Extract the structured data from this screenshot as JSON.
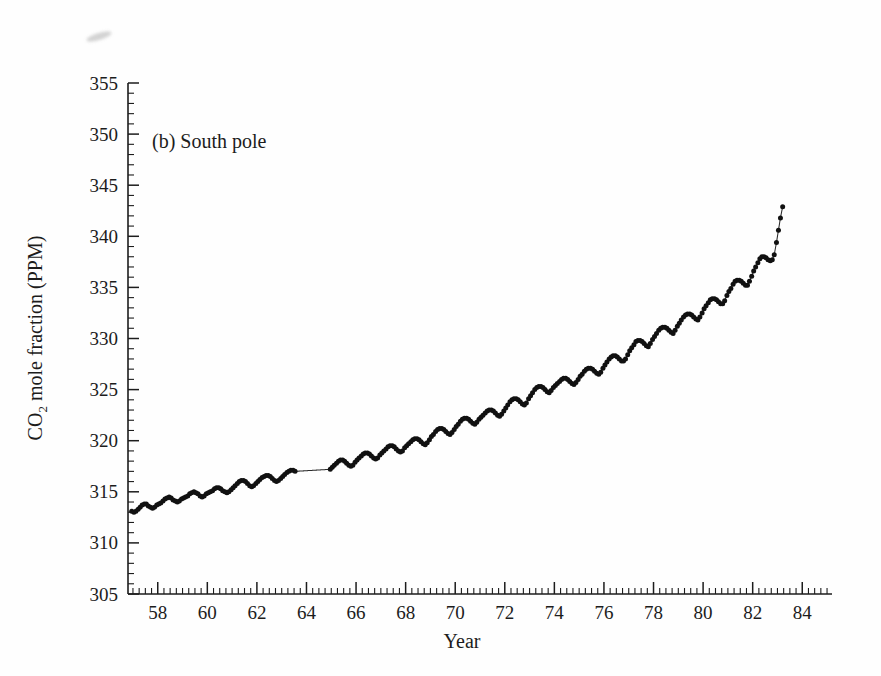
{
  "figure": {
    "panel_label": "(b) South pole",
    "background_color": "#fefefe",
    "ink_color": "#1a1a1a"
  },
  "artifact": {
    "name": "scan-smudge",
    "description": "faint grey scanning smudge near top-left"
  },
  "chart_data": {
    "type": "line",
    "title": "(b) South pole",
    "xlabel": "Year",
    "ylabel": "CO2 mole fraction (PPM)",
    "ylabel_rich": {
      "prefix": "CO",
      "subscript": "2",
      "suffix": " mole fraction (PPM)"
    },
    "xlim": [
      56.8,
      85.2
    ],
    "ylim": [
      305,
      355
    ],
    "xticks": [
      58,
      60,
      62,
      64,
      66,
      68,
      70,
      72,
      74,
      76,
      78,
      80,
      82,
      84
    ],
    "xtick_labels": [
      "58",
      "60",
      "62",
      "64",
      "66",
      "68",
      "70",
      "72",
      "74",
      "76",
      "78",
      "80",
      "82",
      "84"
    ],
    "yticks": [
      305,
      310,
      315,
      320,
      325,
      330,
      335,
      340,
      345,
      350,
      355
    ],
    "ytick_labels": [
      "305",
      "310",
      "315",
      "320",
      "325",
      "330",
      "335",
      "340",
      "345",
      "350",
      "355"
    ],
    "x_minor_tick_interval": 0.25,
    "y_minor_tick_interval": 1,
    "grid": false,
    "legend": null,
    "marker": "dot",
    "series": [
      {
        "name": "South Pole CO2 mole fraction",
        "units": "PPM",
        "x_units": "year (19xx)",
        "data_gap_years": [
          [
            63.6,
            64.9
          ]
        ],
        "x": [
          56.95,
          57.04,
          57.12,
          57.21,
          57.29,
          57.37,
          57.46,
          57.54,
          57.62,
          57.71,
          57.79,
          57.87,
          57.96,
          58.04,
          58.12,
          58.21,
          58.29,
          58.37,
          58.46,
          58.54,
          58.62,
          58.71,
          58.79,
          58.87,
          58.96,
          59.04,
          59.12,
          59.21,
          59.29,
          59.37,
          59.46,
          59.54,
          59.62,
          59.71,
          59.79,
          59.87,
          59.96,
          60.04,
          60.12,
          60.21,
          60.29,
          60.37,
          60.46,
          60.54,
          60.62,
          60.71,
          60.79,
          60.87,
          60.96,
          61.04,
          61.12,
          61.21,
          61.29,
          61.37,
          61.46,
          61.54,
          61.62,
          61.71,
          61.79,
          61.87,
          61.96,
          62.04,
          62.12,
          62.21,
          62.29,
          62.37,
          62.46,
          62.54,
          62.62,
          62.71,
          62.79,
          62.87,
          62.96,
          63.04,
          63.12,
          63.21,
          63.29,
          63.37,
          63.46,
          63.54,
          64.96,
          65.04,
          65.12,
          65.21,
          65.29,
          65.37,
          65.46,
          65.54,
          65.62,
          65.71,
          65.79,
          65.87,
          65.96,
          66.04,
          66.12,
          66.21,
          66.29,
          66.37,
          66.46,
          66.54,
          66.62,
          66.71,
          66.79,
          66.87,
          66.96,
          67.04,
          67.12,
          67.21,
          67.29,
          67.37,
          67.46,
          67.54,
          67.62,
          67.71,
          67.79,
          67.87,
          67.96,
          68.04,
          68.12,
          68.21,
          68.29,
          68.37,
          68.46,
          68.54,
          68.62,
          68.71,
          68.79,
          68.87,
          68.96,
          69.04,
          69.12,
          69.21,
          69.29,
          69.37,
          69.46,
          69.54,
          69.62,
          69.71,
          69.79,
          69.87,
          69.96,
          70.04,
          70.12,
          70.21,
          70.29,
          70.37,
          70.46,
          70.54,
          70.62,
          70.71,
          70.79,
          70.87,
          70.96,
          71.04,
          71.12,
          71.21,
          71.29,
          71.37,
          71.46,
          71.54,
          71.62,
          71.71,
          71.79,
          71.87,
          71.96,
          72.04,
          72.12,
          72.21,
          72.29,
          72.37,
          72.46,
          72.54,
          72.62,
          72.71,
          72.79,
          72.87,
          72.96,
          73.04,
          73.12,
          73.21,
          73.29,
          73.37,
          73.46,
          73.54,
          73.62,
          73.71,
          73.79,
          73.87,
          73.96,
          74.04,
          74.12,
          74.21,
          74.29,
          74.37,
          74.46,
          74.54,
          74.62,
          74.71,
          74.79,
          74.87,
          74.96,
          75.04,
          75.12,
          75.21,
          75.29,
          75.37,
          75.46,
          75.54,
          75.62,
          75.71,
          75.79,
          75.87,
          75.96,
          76.04,
          76.12,
          76.21,
          76.29,
          76.37,
          76.46,
          76.54,
          76.62,
          76.71,
          76.79,
          76.87,
          76.96,
          77.04,
          77.12,
          77.21,
          77.29,
          77.37,
          77.46,
          77.54,
          77.62,
          77.71,
          77.79,
          77.87,
          77.96,
          78.04,
          78.12,
          78.21,
          78.29,
          78.37,
          78.46,
          78.54,
          78.62,
          78.71,
          78.79,
          78.87,
          78.96,
          79.04,
          79.12,
          79.21,
          79.29,
          79.37,
          79.46,
          79.54,
          79.62,
          79.71,
          79.79,
          79.87,
          79.96,
          80.04,
          80.12,
          80.21,
          80.29,
          80.37,
          80.46,
          80.54,
          80.62,
          80.71,
          80.79,
          80.87,
          80.96,
          81.04,
          81.12,
          81.21,
          81.29,
          81.37,
          81.46,
          81.54,
          81.62,
          81.71,
          81.79,
          81.87,
          81.96,
          82.04,
          82.12,
          82.21,
          82.29,
          82.37,
          82.46,
          82.54,
          82.62,
          82.71,
          82.79,
          82.87,
          82.96,
          83.04,
          83.12,
          83.21
        ],
        "y": [
          313.1,
          313.0,
          313.1,
          313.3,
          313.5,
          313.7,
          313.8,
          313.8,
          313.6,
          313.5,
          313.4,
          313.5,
          313.7,
          313.8,
          313.9,
          314.1,
          314.3,
          314.4,
          314.5,
          314.4,
          314.2,
          314.1,
          314.0,
          314.1,
          314.3,
          314.4,
          314.5,
          314.6,
          314.8,
          314.9,
          315.0,
          314.9,
          314.8,
          314.6,
          314.5,
          314.6,
          314.8,
          314.9,
          315.0,
          315.1,
          315.3,
          315.4,
          315.4,
          315.3,
          315.1,
          315.0,
          314.9,
          315.0,
          315.2,
          315.4,
          315.6,
          315.8,
          316.0,
          316.1,
          316.1,
          316.0,
          315.8,
          315.6,
          315.5,
          315.6,
          315.8,
          316.0,
          316.2,
          316.4,
          316.5,
          316.6,
          316.6,
          316.5,
          316.3,
          316.1,
          316.0,
          316.1,
          316.3,
          316.5,
          316.7,
          316.9,
          317.0,
          317.1,
          317.1,
          317.0,
          317.2,
          317.4,
          317.6,
          317.8,
          318.0,
          318.1,
          318.1,
          318.0,
          317.8,
          317.6,
          317.5,
          317.6,
          317.9,
          318.1,
          318.3,
          318.5,
          318.7,
          318.8,
          318.8,
          318.7,
          318.5,
          318.3,
          318.2,
          318.3,
          318.6,
          318.8,
          319.0,
          319.2,
          319.4,
          319.5,
          319.5,
          319.4,
          319.2,
          319.0,
          318.9,
          319.0,
          319.3,
          319.5,
          319.7,
          319.9,
          320.1,
          320.2,
          320.2,
          320.1,
          319.9,
          319.7,
          319.6,
          319.8,
          320.1,
          320.4,
          320.6,
          320.9,
          321.1,
          321.2,
          321.2,
          321.1,
          320.9,
          320.7,
          320.6,
          320.8,
          321.1,
          321.4,
          321.6,
          321.9,
          322.1,
          322.2,
          322.2,
          322.1,
          321.9,
          321.7,
          321.6,
          321.8,
          322.1,
          322.3,
          322.5,
          322.7,
          322.9,
          323.0,
          323.0,
          322.9,
          322.7,
          322.5,
          322.4,
          322.6,
          322.9,
          323.2,
          323.5,
          323.8,
          324.0,
          324.1,
          324.1,
          324.0,
          323.8,
          323.6,
          323.5,
          323.7,
          324.1,
          324.4,
          324.7,
          325.0,
          325.2,
          325.3,
          325.3,
          325.2,
          325.0,
          324.8,
          324.7,
          324.9,
          325.2,
          325.4,
          325.6,
          325.8,
          326.0,
          326.1,
          326.1,
          326.0,
          325.8,
          325.6,
          325.5,
          325.7,
          326.0,
          326.3,
          326.5,
          326.8,
          327.0,
          327.1,
          327.1,
          327.0,
          326.8,
          326.6,
          326.5,
          326.7,
          327.1,
          327.4,
          327.7,
          328.0,
          328.2,
          328.3,
          328.3,
          328.2,
          328.0,
          327.8,
          327.8,
          328.0,
          328.4,
          328.8,
          329.1,
          329.4,
          329.7,
          329.8,
          329.8,
          329.7,
          329.5,
          329.3,
          329.2,
          329.5,
          329.9,
          330.2,
          330.5,
          330.8,
          331.0,
          331.1,
          331.1,
          331.0,
          330.8,
          330.6,
          330.5,
          330.8,
          331.2,
          331.5,
          331.8,
          332.1,
          332.3,
          332.4,
          332.4,
          332.3,
          332.1,
          331.9,
          331.8,
          332.1,
          332.5,
          332.9,
          333.2,
          333.5,
          333.8,
          333.9,
          333.9,
          333.8,
          333.6,
          333.4,
          333.4,
          333.7,
          334.2,
          334.6,
          334.9,
          335.3,
          335.6,
          335.7,
          335.7,
          335.6,
          335.4,
          335.2,
          335.2,
          335.6,
          336.1,
          336.6,
          337.0,
          337.4,
          337.8,
          338.0,
          338.0,
          337.9,
          337.7,
          337.6,
          337.7,
          338.2,
          339.4,
          340.6,
          341.8,
          342.9
        ],
        "description": "Monthly-resolution CO2 record showing rising trend with ~1 ppm seasonal oscillation; smooth fitted line drawn through dense data dots."
      }
    ],
    "range_summary": {
      "start_year": 1957,
      "end_year": 1983,
      "start_value": 313.1,
      "end_value": 342.9,
      "seasonal_amplitude_ppm": 1.0
    }
  }
}
